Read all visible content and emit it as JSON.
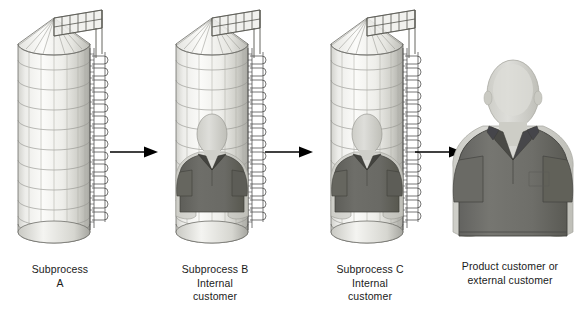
{
  "diagram": {
    "type": "process-flow",
    "title_visible": false,
    "background_color": "#ffffff",
    "orientation": "left-to-right",
    "node_count": 4,
    "arrow_count": 3
  },
  "palette": {
    "silo_body_light": "#f2f2f0",
    "silo_body_mid": "#e2e2de",
    "silo_body_dark": "#b9b9b4",
    "silo_outline": "#6e6e6a",
    "roof_light": "#fafaf8",
    "roof_shade": "#d8d8d4",
    "ladder_dark": "#4a4a48",
    "person_skin": "#d9d9d4",
    "person_skin_shade": "#c3c3bd",
    "person_shirt": "#6b6b66",
    "person_collar": "#4a4a46",
    "person_shirt_large": "#6f6f6a",
    "arrow_color": "#000000",
    "text_color": "#1a1a1a"
  },
  "nodes": [
    {
      "id": "subprocess-a",
      "kind": "silo",
      "has_person": false,
      "caption": "Subprocess\nA",
      "caption_lines": [
        "Subprocess",
        "A"
      ]
    },
    {
      "id": "subprocess-b",
      "kind": "silo",
      "has_person": true,
      "caption": "Subprocess B\nInternal\ncustomer",
      "caption_lines": [
        "Subprocess B",
        "Internal",
        "customer"
      ]
    },
    {
      "id": "subprocess-c",
      "kind": "silo",
      "has_person": true,
      "caption": "Subprocess C\nInternal\ncustomer",
      "caption_lines": [
        "Subprocess C",
        "Internal",
        "customer"
      ]
    },
    {
      "id": "product-customer",
      "kind": "person",
      "has_person": true,
      "caption": "Product customer or\nexternal customer",
      "caption_lines": [
        "Product customer or",
        "external customer"
      ]
    }
  ],
  "arrows": [
    {
      "id": "arrow-a-to-b",
      "from": "subprocess-a",
      "to": "subprocess-b",
      "direction": "right"
    },
    {
      "id": "arrow-b-to-c",
      "from": "subprocess-b",
      "to": "subprocess-c",
      "direction": "right"
    },
    {
      "id": "arrow-c-to-customer",
      "from": "subprocess-c",
      "to": "product-customer",
      "direction": "right"
    }
  ]
}
